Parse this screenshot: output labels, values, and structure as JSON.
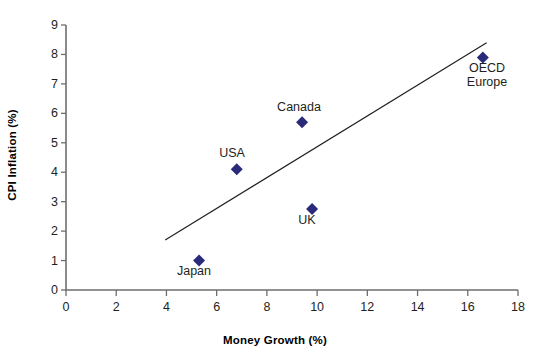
{
  "chart_data": {
    "type": "scatter",
    "title": "",
    "xlabel": "Money Growth (%)",
    "ylabel": "CPI Inflation (%)",
    "xlim": [
      0,
      18
    ],
    "ylim": [
      0,
      9
    ],
    "xticks": [
      0,
      2,
      4,
      6,
      8,
      10,
      12,
      14,
      16,
      18
    ],
    "yticks": [
      0,
      1,
      2,
      3,
      4,
      5,
      6,
      7,
      8,
      9
    ],
    "grid": false,
    "legend": "none",
    "marker": {
      "shape": "diamond",
      "color": "#2a2a7a",
      "size": 9
    },
    "points": [
      {
        "name": "Japan",
        "x": 5.3,
        "y": 1.0,
        "label": "Japan",
        "label_position": "below"
      },
      {
        "name": "USA",
        "x": 6.8,
        "y": 4.1,
        "label": "USA",
        "label_position": "above"
      },
      {
        "name": "Canada",
        "x": 9.4,
        "y": 5.7,
        "label": "Canada",
        "label_position": "above"
      },
      {
        "name": "UK",
        "x": 9.8,
        "y": 2.75,
        "label": "UK",
        "label_position": "below"
      },
      {
        "name": "OECD Europe",
        "x": 16.6,
        "y": 7.9,
        "label": "OECD\nEurope",
        "label_position": "below"
      }
    ],
    "trendline": {
      "type": "line",
      "color": "#231f20",
      "x_start": 3.95,
      "y_start": 1.7,
      "x_end": 16.75,
      "y_end": 8.4
    },
    "axis_color": "#6d6e71"
  },
  "labels": {
    "japan": "Japan",
    "usa": "USA",
    "canada": "Canada",
    "uk": "UK",
    "oecd_line1": "OECD",
    "oecd_line2": "Europe"
  },
  "axes": {
    "x_title": "Money Growth (%)",
    "y_title": "CPI Inflation (%)",
    "x_tick_0": "0",
    "x_tick_2": "2",
    "x_tick_4": "4",
    "x_tick_6": "6",
    "x_tick_8": "8",
    "x_tick_10": "10",
    "x_tick_12": "12",
    "x_tick_14": "14",
    "x_tick_16": "16",
    "x_tick_18": "18",
    "y_tick_0": "0",
    "y_tick_1": "1",
    "y_tick_2": "2",
    "y_tick_3": "3",
    "y_tick_4": "4",
    "y_tick_5": "5",
    "y_tick_6": "6",
    "y_tick_7": "7",
    "y_tick_8": "8",
    "y_tick_9": "9"
  }
}
